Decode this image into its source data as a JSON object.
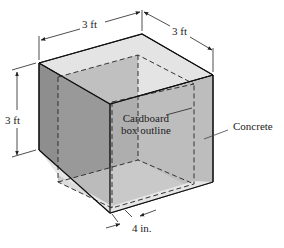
{
  "diagram": {
    "type": "isometric-box",
    "labels": {
      "width_top_left": "3 ft",
      "width_top_right": "3 ft",
      "height_left": "3 ft",
      "inner_box_line1": "Cardboard",
      "inner_box_line2": "box outline",
      "material": "Concrete",
      "wall_thickness": "4 in."
    },
    "colors": {
      "left_face": "#8e8e8e",
      "right_face": "#bdbdbd",
      "top_rim": "#e4e4e4",
      "inner_back": "#a9a9a9",
      "inner_floor": "#c8c8c8",
      "edge": "#111111",
      "dashed": "#333333"
    }
  }
}
